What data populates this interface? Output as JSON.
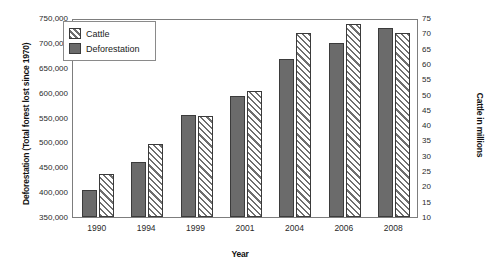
{
  "chart_data": {
    "type": "bar",
    "title": "",
    "xlabel": "Year",
    "ylabel": "Deforestation (Total forest lost since 1970)",
    "ylabel_secondary": "Cattle in millions",
    "categories": [
      "1990",
      "1994",
      "1999",
      "2001",
      "2004",
      "2006",
      "2008"
    ],
    "series": [
      {
        "name": "Deforestation",
        "axis": "left",
        "unit": "km2 total forest lost since 1970",
        "values": [
          405000,
          460000,
          555000,
          593000,
          667000,
          700000,
          730000
        ]
      },
      {
        "name": "Cattle",
        "axis": "right",
        "unit": "millions",
        "values": [
          24,
          34,
          43,
          51,
          70,
          73,
          70
        ]
      }
    ],
    "ylim": [
      350000,
      750000
    ],
    "ylim_secondary": [
      10,
      75
    ],
    "yticks": [
      "350,000",
      "400,000",
      "450,000",
      "500,000",
      "550,000",
      "600,000",
      "650,000",
      "700,000",
      "750,000"
    ],
    "ytick_values": [
      350000,
      400000,
      450000,
      500000,
      550000,
      600000,
      650000,
      700000,
      750000
    ],
    "yticks_secondary": [
      "10",
      "15",
      "20",
      "25",
      "30",
      "35",
      "40",
      "45",
      "50",
      "55",
      "60",
      "65",
      "70",
      "75"
    ],
    "ytick_values_secondary": [
      10,
      15,
      20,
      25,
      30,
      35,
      40,
      45,
      50,
      55,
      60,
      65,
      70,
      75
    ],
    "grid": false,
    "legend_position": "top-left",
    "legend": [
      "Cattle",
      "Deforestation"
    ],
    "colors": {
      "deforestation_fill": "#6b6b6b",
      "cattle_fill": "#ffffff",
      "hatch": "#6f6f6f",
      "outline": "#3b3b3b",
      "frame": "#7d7d7d"
    }
  }
}
